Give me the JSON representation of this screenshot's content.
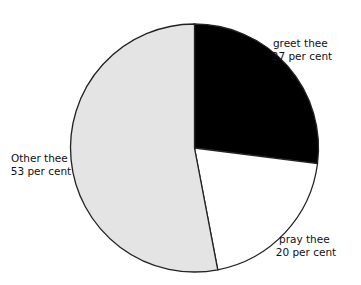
{
  "chart_data": {
    "type": "pie",
    "title": "",
    "start": "top",
    "direction": "clockwise",
    "slices": [
      {
        "label": "greet thee",
        "value": 27,
        "value_text": "27 per cent",
        "color": "#000000"
      },
      {
        "label": "pray thee",
        "value": 20,
        "value_text": "20 per cent",
        "color": "#ffffff"
      },
      {
        "label": "Other thee",
        "value": 53,
        "value_text": "53 per cent",
        "color": "#e4e4e4"
      }
    ],
    "unit": "per cent",
    "legend": "none",
    "labels_position": "outside"
  }
}
